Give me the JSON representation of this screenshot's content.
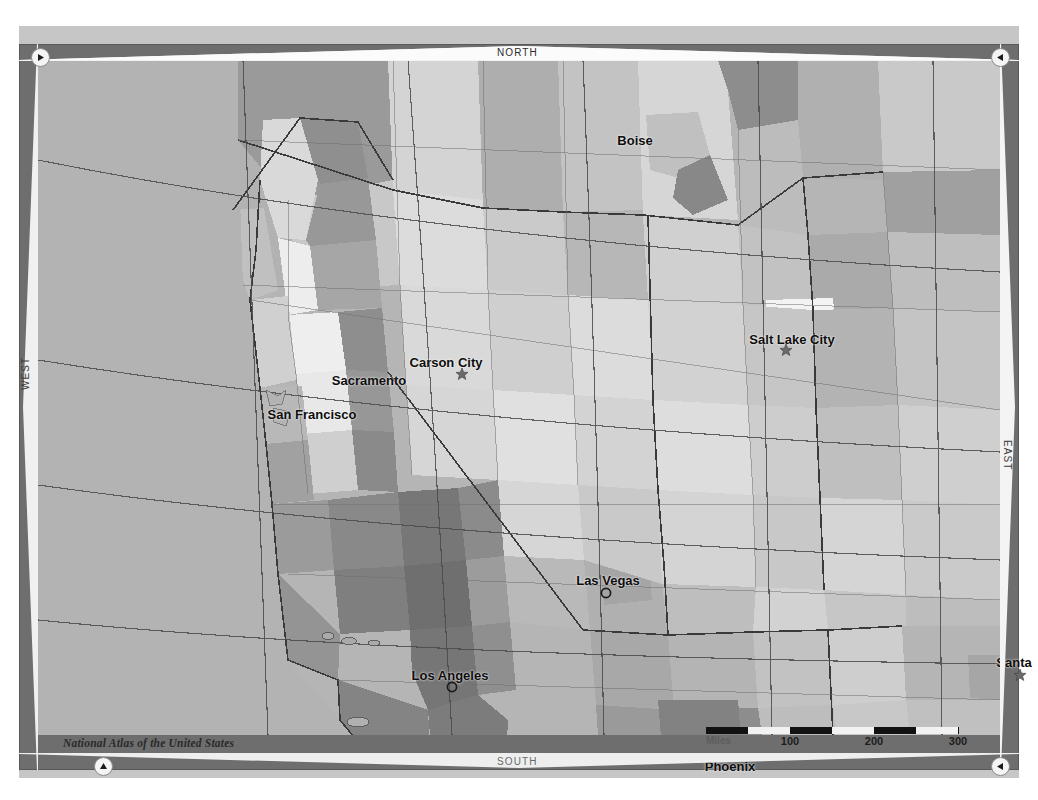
{
  "map": {
    "title": "National Atlas Map Viewer",
    "attribution": "National Atlas of the United States",
    "background_color": "#b9b9b9",
    "frame_color": "#6e6e6e",
    "mat_color": "#c6c6c6"
  },
  "directions": {
    "north": "NORTH",
    "south": "SOUTH",
    "east": "EAST",
    "west": "WEST"
  },
  "nav": {
    "top_left": "▶",
    "top_right": "◀",
    "bottom_left": "▲",
    "bottom_right": "◀"
  },
  "cities": [
    {
      "name": "Boise",
      "x": 597,
      "y": 80,
      "marker": "none",
      "mx": 0,
      "my": 0,
      "anchor": "middle"
    },
    {
      "name": "Salt Lake City",
      "x": 754,
      "y": 279,
      "marker": "star",
      "mx": 748,
      "my": 290,
      "anchor": "middle"
    },
    {
      "name": "Carson City",
      "x": 408,
      "y": 302,
      "marker": "star",
      "mx": 424,
      "my": 314,
      "anchor": "middle"
    },
    {
      "name": "Sacramento",
      "x": 331,
      "y": 320,
      "marker": "none",
      "mx": 0,
      "my": 0,
      "anchor": "middle"
    },
    {
      "name": "San Francisco",
      "x": 274,
      "y": 354,
      "marker": "none",
      "mx": 0,
      "my": 0,
      "anchor": "middle"
    },
    {
      "name": "Las Vegas",
      "x": 570,
      "y": 520,
      "marker": "circle",
      "mx": 568,
      "my": 533,
      "anchor": "middle"
    },
    {
      "name": "Santa",
      "x": 976,
      "y": 602,
      "marker": "star",
      "mx": 982,
      "my": 615,
      "anchor": "middle"
    },
    {
      "name": "Los Angeles",
      "x": 412,
      "y": 615,
      "marker": "circle",
      "mx": 414,
      "my": 627,
      "anchor": "middle"
    },
    {
      "name": "Phoenix",
      "x": 692,
      "y": 706,
      "marker": "none",
      "mx": 0,
      "my": 0,
      "anchor": "middle"
    }
  ],
  "scalebar": {
    "unit": "Miles",
    "ticks": [
      "100",
      "200",
      "300"
    ],
    "tick_positions": [
      84,
      168,
      252
    ],
    "segments": [
      "on",
      "off",
      "on",
      "off",
      "on",
      "off"
    ],
    "max_value": 300
  },
  "chart_data": {
    "type": "map",
    "projection": "conic",
    "region": "Southwestern United States",
    "shading": "grayscale county choropleth",
    "graticule": true,
    "palette": [
      "#d8d8d8",
      "#cccccc",
      "#bfbfbf",
      "#b2b2b2",
      "#a4a4a4",
      "#949494",
      "#858585",
      "#777777",
      "#f0f0f0"
    ],
    "labeled_places": [
      "Boise",
      "Salt Lake City",
      "Carson City",
      "Sacramento",
      "San Francisco",
      "Las Vegas",
      "Santa",
      "Los Angeles",
      "Phoenix"
    ]
  }
}
